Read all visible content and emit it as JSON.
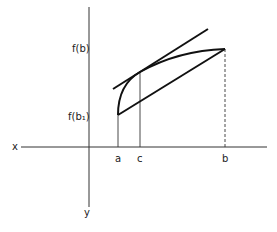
{
  "diagram": {
    "axis_labels": {
      "x": "x",
      "y": "y"
    },
    "tick_labels": {
      "a": "a",
      "c": "c",
      "b": "b"
    },
    "value_labels": {
      "fb": "f(b)",
      "fa": "f(b₁)"
    },
    "colors": {
      "ink": "#111111",
      "thin": "#333333",
      "background": "#ffffff"
    }
  }
}
